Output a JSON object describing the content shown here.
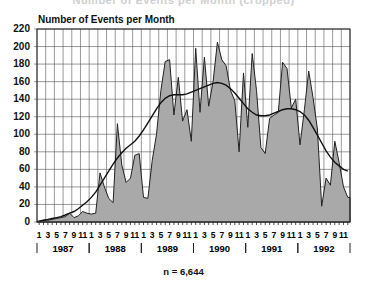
{
  "header": {
    "top_title": "Number of Events per Month (cropped)"
  },
  "chart_data": {
    "type": "area",
    "title": "Number of Events per Month",
    "ylabel": "Number of Events per Month",
    "xlabel": "",
    "ylim": [
      0,
      220
    ],
    "yticks": [
      0,
      20,
      40,
      60,
      80,
      100,
      120,
      140,
      160,
      180,
      200,
      220
    ],
    "grid": true,
    "month_tick_labels": [
      "1",
      "3",
      "5",
      "7",
      "9",
      "11"
    ],
    "years": [
      "1987",
      "1988",
      "1989",
      "1990",
      "1991",
      "1992"
    ],
    "annotation": "n = 6,644",
    "x": [
      "1987-01",
      "1987-02",
      "1987-03",
      "1987-04",
      "1987-05",
      "1987-06",
      "1987-07",
      "1987-08",
      "1987-09",
      "1987-10",
      "1987-11",
      "1987-12",
      "1988-01",
      "1988-02",
      "1988-03",
      "1988-04",
      "1988-05",
      "1988-06",
      "1988-07",
      "1988-08",
      "1988-09",
      "1988-10",
      "1988-11",
      "1988-12",
      "1989-01",
      "1989-02",
      "1989-03",
      "1989-04",
      "1989-05",
      "1989-06",
      "1989-07",
      "1989-08",
      "1989-09",
      "1989-10",
      "1989-11",
      "1989-12",
      "1990-01",
      "1990-02",
      "1990-03",
      "1990-04",
      "1990-05",
      "1990-06",
      "1990-07",
      "1990-08",
      "1990-09",
      "1990-10",
      "1990-11",
      "1990-12",
      "1991-01",
      "1991-02",
      "1991-03",
      "1991-04",
      "1991-05",
      "1991-06",
      "1991-07",
      "1991-08",
      "1991-09",
      "1991-10",
      "1991-11",
      "1991-12",
      "1992-01",
      "1992-02",
      "1992-03",
      "1992-04",
      "1992-05",
      "1992-06",
      "1992-07",
      "1992-08",
      "1992-09",
      "1992-10",
      "1992-11",
      "1992-12"
    ],
    "series": [
      {
        "name": "Monthly events",
        "style": "filled-area",
        "values": [
          1,
          2,
          2,
          3,
          4,
          5,
          6,
          10,
          5,
          7,
          12,
          10,
          9,
          10,
          56,
          40,
          27,
          22,
          112,
          65,
          45,
          50,
          76,
          78,
          28,
          27,
          70,
          100,
          150,
          183,
          185,
          122,
          165,
          115,
          128,
          92,
          198,
          125,
          188,
          132,
          160,
          205,
          185,
          178,
          150,
          138,
          80,
          170,
          108,
          192,
          150,
          85,
          78,
          118,
          122,
          125,
          182,
          175,
          130,
          140,
          88,
          128,
          172,
          142,
          106,
          18,
          50,
          42,
          92,
          68,
          40,
          28
        ]
      },
      {
        "name": "Smoothed trend",
        "style": "line",
        "values": [
          1,
          2,
          3,
          4,
          5,
          6,
          8,
          10,
          12,
          15,
          19,
          23,
          28,
          34,
          42,
          50,
          58,
          66,
          73,
          79,
          84,
          88,
          92,
          98,
          105,
          113,
          121,
          129,
          136,
          141,
          144,
          145,
          145,
          145,
          146,
          148,
          150,
          152,
          154,
          156,
          158,
          159,
          158,
          156,
          152,
          147,
          141,
          135,
          129,
          125,
          122,
          121,
          121,
          122,
          124,
          126,
          128,
          129,
          129,
          128,
          126,
          122,
          116,
          108,
          99,
          90,
          81,
          74,
          68,
          64,
          60,
          58
        ]
      }
    ]
  }
}
